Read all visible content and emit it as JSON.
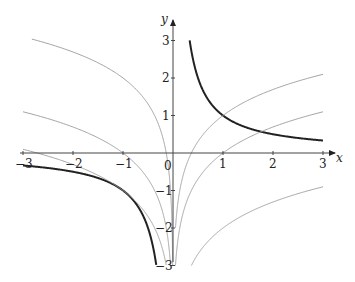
{
  "chart_data": {
    "type": "line",
    "title": "",
    "xlabel": "x",
    "ylabel": "y",
    "xlim": [
      -3,
      3
    ],
    "ylim": [
      -3,
      3
    ],
    "grid": false,
    "x_ticks": [
      "-3",
      "-2",
      "-1",
      "0",
      "1",
      "2",
      "3"
    ],
    "y_ticks": [
      "-3",
      "-2",
      "-1",
      "1",
      "2",
      "3"
    ],
    "series": [
      {
        "name": "y = 1/x (x>0)",
        "style": "thick",
        "color": "#222222",
        "formula": "1/x",
        "domain": [
          0.333,
          3
        ]
      },
      {
        "name": "y = 1/x (x<0)",
        "style": "thick",
        "color": "#222222",
        "formula": "1/x",
        "domain": [
          -3,
          -0.333
        ]
      },
      {
        "name": "y = ln|x| + 1 (x>0)",
        "style": "thin",
        "color": "#999999",
        "formula": "ln(x)+1",
        "domain": [
          0.0498,
          3
        ]
      },
      {
        "name": "y = ln|x| (x>0)",
        "style": "thin",
        "color": "#999999",
        "formula": "ln(x)",
        "domain": [
          0.0498,
          3
        ]
      },
      {
        "name": "y = ln|x| - 2 (x>0)",
        "style": "thin",
        "color": "#999999",
        "formula": "ln(x)-2",
        "domain": [
          0.368,
          3
        ]
      },
      {
        "name": "y = ln|x| + 2 (x<0)",
        "style": "thin",
        "color": "#999999",
        "formula": "ln(-x)+2",
        "domain": [
          -3,
          -0.0067
        ]
      },
      {
        "name": "y = ln|x| (x<0)",
        "style": "thin",
        "color": "#999999",
        "formula": "ln(-x)",
        "domain": [
          -3,
          -0.0498
        ]
      },
      {
        "name": "y = ln|x| - 1 (x<0)",
        "style": "thin",
        "color": "#999999",
        "formula": "ln(-x)-1",
        "domain": [
          -3,
          -0.1353
        ]
      }
    ],
    "sample_points": {
      "y = 1/x": [
        [
          0.333,
          3
        ],
        [
          0.5,
          2
        ],
        [
          1,
          1
        ],
        [
          2,
          0.5
        ],
        [
          3,
          0.333
        ],
        [
          -0.333,
          -3
        ],
        [
          -0.5,
          -2
        ],
        [
          -1,
          -1
        ],
        [
          -2,
          -0.5
        ],
        [
          -3,
          -0.333
        ]
      ],
      "y = ln|x| + 1": [
        [
          0.135,
          -1
        ],
        [
          0.368,
          0
        ],
        [
          1,
          1
        ],
        [
          2,
          1.69
        ],
        [
          3,
          2.1
        ]
      ],
      "y = ln|x|": [
        [
          0.368,
          -1
        ],
        [
          1,
          0
        ],
        [
          2,
          0.69
        ],
        [
          3,
          1.1
        ],
        [
          -1,
          0
        ],
        [
          -2,
          0.69
        ],
        [
          -3,
          1.1
        ]
      ],
      "y = ln|x| - 2": [
        [
          1,
          -2
        ],
        [
          2,
          -1.31
        ],
        [
          3,
          -0.9
        ]
      ],
      "y = ln|x| + 2": [
        [
          -0.368,
          1
        ],
        [
          -1,
          2
        ],
        [
          -2,
          2.69
        ],
        [
          -3,
          3.1
        ]
      ],
      "y = ln|x| - 1": [
        [
          -1,
          -1
        ],
        [
          -2,
          -0.31
        ],
        [
          -3,
          0.1
        ]
      ]
    }
  },
  "axes": {
    "x_label": "x",
    "y_label": "y",
    "origin_label": "0"
  },
  "layout": {
    "origin_px": [
      173,
      153
    ],
    "px_per_unit_x": 50,
    "px_per_unit_y": 37.5
  }
}
